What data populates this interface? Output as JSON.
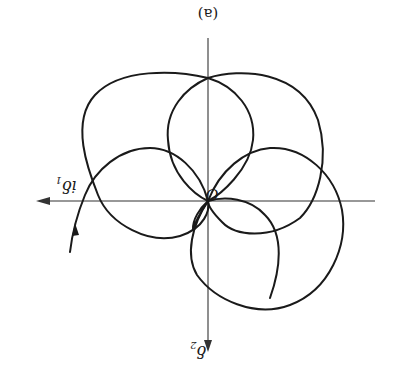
{
  "figure": {
    "caption": "(a)",
    "orientation": "rotated 180 degrees",
    "origin_label": "O",
    "horizontal_axis": {
      "label_main": "iδ",
      "label_sub": "1"
    },
    "vertical_axis": {
      "label_main": "δ",
      "label_sub": "2"
    },
    "curve_description": "Rosette-like trajectory of overlapping loops passing through origin O, with a direction arrow on the starting branch",
    "colors": {
      "stroke": "#1a1a1a",
      "background": "#ffffff"
    }
  }
}
